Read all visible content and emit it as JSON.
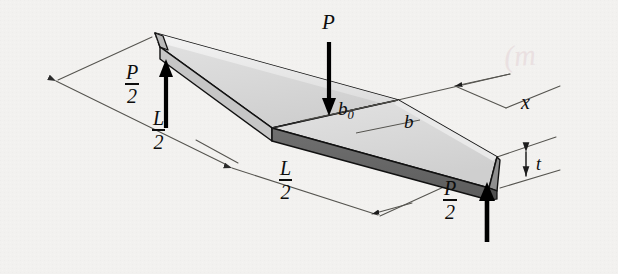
{
  "figure": {
    "background_color": "#f2f1ef",
    "ink_color": "#0d0d0d"
  },
  "labels": {
    "load_P": "P",
    "reaction_left": {
      "numerator": "P",
      "denominator": "2"
    },
    "reaction_right": {
      "numerator": "P",
      "denominator": "2"
    },
    "span_left": {
      "numerator": "L",
      "denominator": "2"
    },
    "span_right": {
      "numerator": "L",
      "denominator": "2"
    },
    "width_root": "b",
    "width_root_subscript": "0",
    "width_local": "b",
    "distance_x": "x",
    "thickness_t": "t"
  },
  "annotations": {
    "bleed_through_text": "(m",
    "scan_artifact": "left-edge-scan-shadow"
  },
  "geometry": {
    "plate_top_fill": "#d9d9d9",
    "plate_top_fill_light": "#e6e6e6",
    "plate_bevel_fill": "#efefef",
    "plate_front_dark_fill": "#656565",
    "plate_front_mid_fill": "#9a9a9a",
    "outline_color": "#111111",
    "dimension_line_color": "#3c3c3c",
    "arrow_color": "#000000"
  }
}
